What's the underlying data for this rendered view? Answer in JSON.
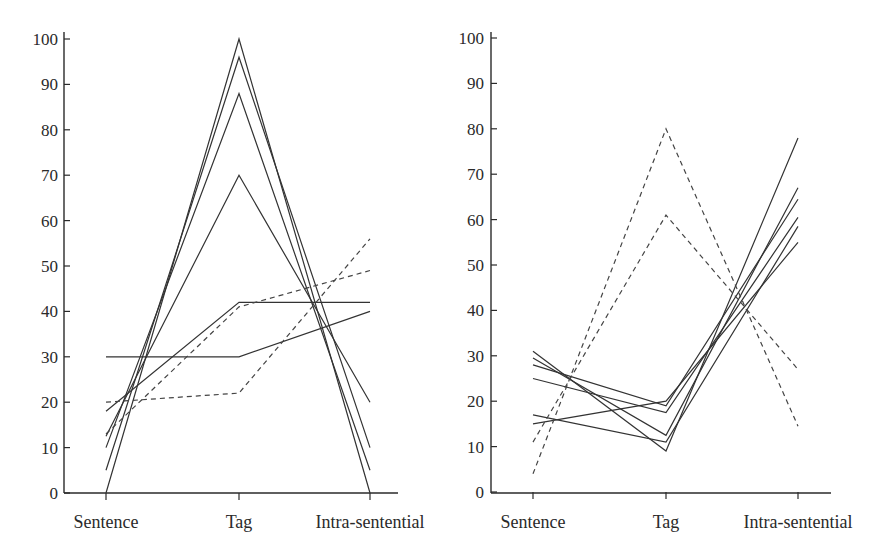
{
  "chart_data": [
    {
      "type": "line",
      "title": "",
      "xlabel": "",
      "ylabel": "",
      "ylim": [
        0,
        100
      ],
      "yticks": [
        0,
        10,
        20,
        30,
        40,
        50,
        60,
        70,
        80,
        90,
        100
      ],
      "categories": [
        "Sentence",
        "Tag",
        "Intra-sentential"
      ],
      "grid": false,
      "legend": null,
      "series": [
        {
          "name": "subject-1",
          "style": "solid",
          "values": [
            0,
            100,
            0
          ]
        },
        {
          "name": "subject-2",
          "style": "solid",
          "values": [
            5,
            96,
            10
          ]
        },
        {
          "name": "subject-3",
          "style": "solid",
          "values": [
            10,
            88,
            5
          ]
        },
        {
          "name": "subject-4",
          "style": "solid",
          "values": [
            12.5,
            70,
            20
          ]
        },
        {
          "name": "subject-5",
          "style": "solid",
          "values": [
            18,
            42,
            42
          ]
        },
        {
          "name": "subject-6",
          "style": "solid",
          "values": [
            30,
            30,
            40
          ]
        },
        {
          "name": "subject-7",
          "style": "dashed",
          "values": [
            13,
            41,
            49
          ]
        },
        {
          "name": "subject-8",
          "style": "dashed",
          "values": [
            20,
            22,
            56
          ]
        }
      ]
    },
    {
      "type": "line",
      "title": "",
      "xlabel": "",
      "ylabel": "",
      "ylim": [
        0,
        100
      ],
      "yticks": [
        0,
        10,
        20,
        30,
        40,
        50,
        60,
        70,
        80,
        90,
        100
      ],
      "categories": [
        "Sentence",
        "Tag",
        "Intra-sentential"
      ],
      "grid": false,
      "legend": null,
      "series": [
        {
          "name": "subject-1",
          "style": "solid",
          "values": [
            31,
            9,
            78
          ]
        },
        {
          "name": "subject-2",
          "style": "solid",
          "values": [
            29.5,
            12.5,
            67
          ]
        },
        {
          "name": "subject-3",
          "style": "solid",
          "values": [
            28,
            19,
            64.5
          ]
        },
        {
          "name": "subject-4",
          "style": "solid",
          "values": [
            25,
            17.5,
            60.5
          ]
        },
        {
          "name": "subject-5",
          "style": "solid",
          "values": [
            17,
            11,
            58.5
          ]
        },
        {
          "name": "subject-6",
          "style": "solid",
          "values": [
            15,
            20,
            55
          ]
        },
        {
          "name": "subject-7",
          "style": "dashed",
          "values": [
            4,
            80,
            14.5
          ]
        },
        {
          "name": "subject-8",
          "style": "dashed",
          "values": [
            11,
            61,
            27
          ]
        }
      ]
    }
  ],
  "panels": [
    {
      "y_labels": [
        "0",
        "10",
        "20",
        "30",
        "40",
        "50",
        "60",
        "70",
        "80",
        "90",
        "100"
      ],
      "x_labels": [
        "Sentence",
        "Tag",
        "Intra-sentential"
      ]
    },
    {
      "y_labels": [
        "0",
        "10",
        "20",
        "30",
        "40",
        "50",
        "60",
        "70",
        "80",
        "90",
        "100"
      ],
      "x_labels": [
        "Sentence",
        "Tag",
        "Intra-sentential"
      ]
    }
  ]
}
